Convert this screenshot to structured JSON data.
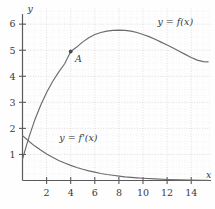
{
  "chart_data": {
    "type": "line",
    "title": "",
    "xlabel": "x",
    "ylabel": "y",
    "xlim": [
      0,
      15.6
    ],
    "ylim": [
      0,
      6.6
    ],
    "grid": true,
    "grid_style": "dotted",
    "legend": "inline-labels",
    "xticks": [
      2,
      4,
      6,
      8,
      10,
      12,
      14
    ],
    "yticks": [
      1,
      2,
      3,
      4,
      5,
      6
    ],
    "series": [
      {
        "name": "y = f(x)",
        "label": "y = f(x)",
        "label_x": 11.2,
        "label_y": 5.95,
        "x": [
          0,
          0.3,
          0.6,
          1,
          1.5,
          2,
          2.5,
          3,
          3.5,
          4,
          4.5,
          5,
          5.5,
          6,
          6.5,
          7,
          7.5,
          8,
          8.5,
          9,
          9.5,
          10,
          10.5,
          11,
          11.5,
          12,
          12.5,
          13,
          13.5,
          14,
          14.5,
          15,
          15.4
        ],
        "y": [
          0.82,
          1.3,
          1.75,
          2.3,
          2.88,
          3.38,
          3.8,
          4.16,
          4.48,
          4.95,
          5.12,
          5.32,
          5.48,
          5.6,
          5.68,
          5.73,
          5.76,
          5.77,
          5.76,
          5.73,
          5.68,
          5.6,
          5.52,
          5.42,
          5.31,
          5.2,
          5.08,
          4.96,
          4.84,
          4.72,
          4.62,
          4.56,
          4.55
        ]
      },
      {
        "name": "y = f'(x)",
        "label": "y = f'(x)",
        "label_x": 3.05,
        "label_y": 1.52,
        "x": [
          0,
          0.3,
          0.6,
          1,
          1.5,
          2,
          2.5,
          3,
          3.5,
          4,
          4.5,
          5,
          5.5,
          6,
          6.5,
          7,
          7.5,
          8,
          8.5,
          9,
          9.5,
          10,
          11,
          12,
          13,
          14,
          15,
          15.4
        ],
        "y": [
          1.72,
          1.6,
          1.48,
          1.33,
          1.17,
          1.02,
          0.89,
          0.77,
          0.67,
          0.58,
          0.5,
          0.43,
          0.37,
          0.32,
          0.27,
          0.23,
          0.2,
          0.17,
          0.14,
          0.12,
          0.1,
          0.085,
          0.06,
          0.04,
          0.025,
          0.015,
          0.008,
          0.006
        ]
      }
    ],
    "annotations": [
      {
        "name": "point-A",
        "label": "A",
        "x": 4,
        "y": 4.95,
        "label_offset_x": 0.35,
        "label_offset_y": -0.42,
        "marker": "dot"
      }
    ],
    "colors": {
      "curve": "#6b6b6b",
      "axis": "#5a5a5a",
      "grid_major": "#c9c9c9",
      "grid_minor": "#e2e2e2",
      "text": "#3a3a3a",
      "background": "#fefefe"
    }
  }
}
